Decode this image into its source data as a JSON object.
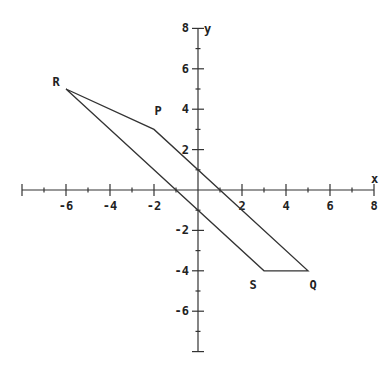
{
  "chart_data": {
    "type": "line",
    "title": "",
    "xlabel": "x",
    "ylabel": "y",
    "xlim": [
      -8,
      8
    ],
    "ylim": [
      -8,
      8
    ],
    "grid": false,
    "x_ticks": {
      "major": [
        -8,
        -6,
        -4,
        -2,
        0,
        2,
        4,
        6,
        8
      ],
      "minor_step": 1
    },
    "y_ticks": {
      "major": [
        -8,
        -6,
        -4,
        -2,
        0,
        2,
        4,
        6,
        8
      ],
      "minor_step": 1
    },
    "x_tick_labels": [
      "-6",
      "-4",
      "-2",
      "2",
      "4",
      "6",
      "8"
    ],
    "y_tick_labels": [
      "8",
      "6",
      "4",
      "2",
      "-2",
      "-4",
      "-6"
    ],
    "shape": "quadrilateral",
    "vertices": [
      {
        "label": "R",
        "x": -6,
        "y": 5
      },
      {
        "label": "P",
        "x": -2,
        "y": 3
      },
      {
        "label": "Q",
        "x": 5,
        "y": -4
      },
      {
        "label": "S",
        "x": 3,
        "y": -4
      }
    ],
    "polygon_order": [
      "R",
      "P",
      "Q",
      "S"
    ],
    "line_color": "#333333",
    "axis_color": "#333333"
  },
  "labels": {
    "x_axis": "x",
    "y_axis": "y",
    "R": "R",
    "P": "P",
    "Q": "Q",
    "S": "S"
  }
}
